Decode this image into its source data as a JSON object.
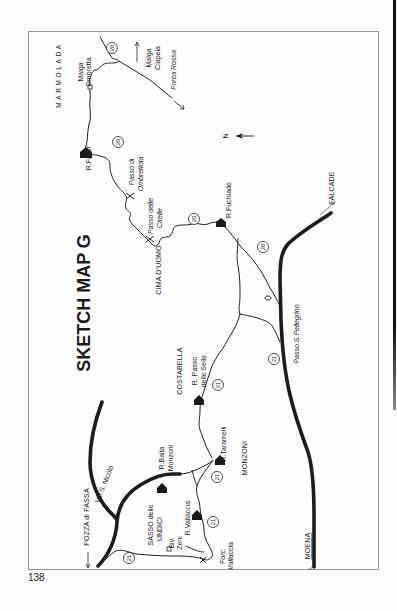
{
  "map": {
    "title": "SKETCH MAP G",
    "north_label": "N",
    "regions": {
      "marmolada": "MARMOLADA",
      "cima_duomo": "CIMA D'UOMO",
      "costabella": "COSTABELLA",
      "monzoni": "MONZONI",
      "sasso_line1": "SASSO delle",
      "sasso_line2": "UNDICI"
    },
    "huts": {
      "falier": "R.Falier",
      "fuchiade": "R.Fuchiade",
      "passo_selle_line1": "R. Passo",
      "passo_selle_line2": "delle Selle",
      "taramelli": "R.Taramelli",
      "baita_line1": "R.Baita",
      "baita_line2": "Monzoni",
      "vallaccia": "R.Vallaccia",
      "biv_line1": "Biv.",
      "biv_line2": "Zeni",
      "malga_ombretta_line1": "Malga",
      "malga_ombretta_line2": "Ombretta",
      "malga_ciapela_line1": "Malga",
      "malga_ciapela_line2": "Ciapela"
    },
    "passes": {
      "ombrettola_line1": "Passo di",
      "ombrettola_line2": "Ombrettola",
      "cirelle_line1": "Passo delle",
      "cirelle_line2": "Cirelle",
      "pellegrino": "Passo S.Pellegrino",
      "forc_vallaccia_line1": "Forc.",
      "forc_vallaccia_line2": "Vallaccia",
      "forca_rossa": "Forca Rossa"
    },
    "towns": {
      "falcade": "FALCADE",
      "moena": "MOENA",
      "pozza": "POZZA di FASSA",
      "val_s_nicolo": "Val S. Nicolò"
    },
    "routes": {
      "r20": "20",
      "r21": "21"
    }
  },
  "page": {
    "number": "138"
  }
}
